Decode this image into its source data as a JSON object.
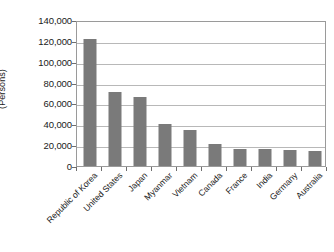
{
  "chart_data": {
    "type": "bar",
    "title": "",
    "subtitle": "",
    "xlabel": "",
    "ylabel": "(Persons)",
    "categories": [
      "Republic of Korea",
      "United States",
      "Japan",
      "Myanmar",
      "Vietnam",
      "Canada",
      "France",
      "India",
      "Germany",
      "Australia"
    ],
    "values": [
      121500,
      71000,
      66000,
      40000,
      35000,
      21000,
      16000,
      16000,
      15500,
      14500
    ],
    "ylim": [
      0,
      140000
    ],
    "ytick_labels": [
      "140,000",
      "120,000",
      "100,000",
      "80,000",
      "60,000",
      "40,000",
      "20,000",
      "0"
    ],
    "ytick_values": [
      140000,
      120000,
      100000,
      80000,
      60000,
      40000,
      20000,
      0
    ],
    "grid": true,
    "legend": false,
    "legend_position": "none",
    "bar_color": "#7a7a7a",
    "gridline_color": "#b8b8b8",
    "axis_color": "#9a9a9a",
    "background_color": "#ffffff"
  }
}
